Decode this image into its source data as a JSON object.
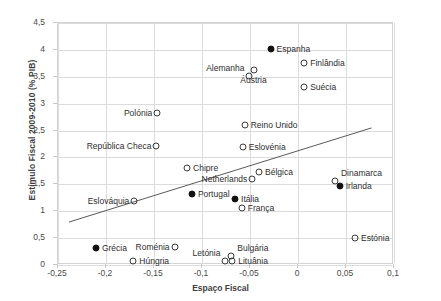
{
  "chart_data": {
    "type": "scatter",
    "title": "",
    "xlabel": "Espaço Fiscal",
    "ylabel": "Estímulo Fiscal  2009-2010 (% PIB)",
    "xlim": [
      -0.25,
      0.1
    ],
    "ylim": [
      0,
      4.5
    ],
    "xticks": [
      "-0,25",
      "-0,2",
      "-0,15",
      "-0,1",
      "-0,05",
      "0",
      "0,05",
      "0,1"
    ],
    "xtick_values": [
      -0.25,
      -0.2,
      -0.15,
      -0.1,
      -0.05,
      0,
      0.05,
      0.1
    ],
    "yticks": [
      "0",
      "0,5",
      "1",
      "1,5",
      "2",
      "2,5",
      "3",
      "3,5",
      "4",
      "4,5"
    ],
    "ytick_values": [
      0,
      0.5,
      1,
      1.5,
      2,
      2.5,
      3,
      3.5,
      4,
      4.5
    ],
    "grid": true,
    "legend": "none",
    "trendline": {
      "x0": -0.2375,
      "y0": 0.78,
      "x1": 0.0775,
      "y1": 2.53
    },
    "points": [
      {
        "label": "Espanha",
        "x": -0.0275,
        "y": 4.0,
        "marker": "filled",
        "label_side": "right"
      },
      {
        "label": "Finlândia",
        "x": 0.0075,
        "y": 3.73,
        "marker": "open",
        "label_side": "right"
      },
      {
        "label": "Alemanha",
        "x": -0.0495,
        "y": 3.5,
        "marker": "open",
        "label_side": "left-above"
      },
      {
        "label": "Áustria",
        "x": -0.0445,
        "y": 3.6,
        "marker": "open",
        "label_side": "below"
      },
      {
        "label": "Suécia",
        "x": 0.0075,
        "y": 3.3,
        "marker": "open",
        "label_side": "right"
      },
      {
        "label": "Polónia",
        "x": -0.1455,
        "y": 2.8,
        "marker": "open",
        "label_side": "left"
      },
      {
        "label": "Reino Unido",
        "x": -0.0545,
        "y": 2.58,
        "marker": "open",
        "label_side": "right"
      },
      {
        "label": "República Checa",
        "x": -0.1465,
        "y": 2.2,
        "marker": "open",
        "label_side": "left"
      },
      {
        "label": "Eslovénia",
        "x": -0.0565,
        "y": 2.18,
        "marker": "open",
        "label_side": "right"
      },
      {
        "label": "Chipre",
        "x": -0.1145,
        "y": 1.78,
        "marker": "open",
        "label_side": "right"
      },
      {
        "label": "Bélgica",
        "x": -0.0395,
        "y": 1.72,
        "marker": "open",
        "label_side": "right"
      },
      {
        "label": "Netherlands",
        "x": -0.0465,
        "y": 1.58,
        "marker": "open",
        "label_side": "left"
      },
      {
        "label": "Dinamarca",
        "x": 0.0395,
        "y": 1.55,
        "marker": "open",
        "label_side": "right-above"
      },
      {
        "label": "Irlanda",
        "x": 0.0445,
        "y": 1.45,
        "marker": "filled",
        "label_side": "right"
      },
      {
        "label": "Portugal",
        "x": -0.1095,
        "y": 1.3,
        "marker": "filled",
        "label_side": "right"
      },
      {
        "label": "Itália",
        "x": -0.0645,
        "y": 1.2,
        "marker": "filled",
        "label_side": "right"
      },
      {
        "label": "Eslováquia",
        "x": -0.1695,
        "y": 1.18,
        "marker": "open",
        "label_side": "left"
      },
      {
        "label": "França",
        "x": -0.0575,
        "y": 1.05,
        "marker": "open",
        "label_side": "right"
      },
      {
        "label": "Estónia",
        "x": 0.0605,
        "y": 0.48,
        "marker": "open",
        "label_side": "right"
      },
      {
        "label": "Roménia",
        "x": -0.1275,
        "y": 0.32,
        "marker": "open",
        "label_side": "left"
      },
      {
        "label": "Grécia",
        "x": -0.2095,
        "y": 0.3,
        "marker": "filled",
        "label_side": "right"
      },
      {
        "label": "Letónia",
        "x": -0.0745,
        "y": 0.06,
        "marker": "open",
        "label_side": "left-above"
      },
      {
        "label": "Bulgária",
        "x": -0.0685,
        "y": 0.14,
        "marker": "open",
        "label_side": "right-above"
      },
      {
        "label": "Lituânia",
        "x": -0.0675,
        "y": 0.06,
        "marker": "open",
        "label_side": "right"
      },
      {
        "label": "Húngria",
        "x": -0.1705,
        "y": 0.05,
        "marker": "open",
        "label_side": "right"
      }
    ]
  }
}
